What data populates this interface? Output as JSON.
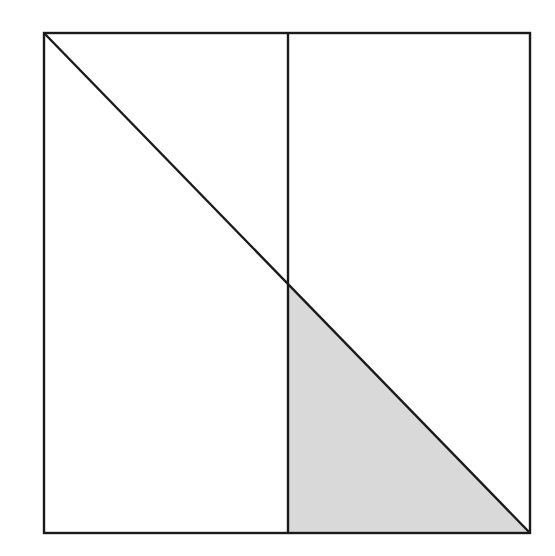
{
  "diagram": {
    "type": "geometry",
    "colors": {
      "stroke": "#1a1a1a",
      "fill_shaded": "#d9d9d9",
      "background": "#ffffff"
    },
    "square": {
      "x1": 44,
      "y1": 33,
      "x2": 530,
      "y2": 533
    },
    "vertical_line": {
      "x": 288,
      "y1": 33,
      "y2": 533
    },
    "diagonal": {
      "x1": 44,
      "y1": 33,
      "x2": 530,
      "y2": 533
    },
    "shaded_triangle": {
      "points": [
        [
          288,
          284
        ],
        [
          288,
          533
        ],
        [
          530,
          533
        ]
      ]
    }
  }
}
